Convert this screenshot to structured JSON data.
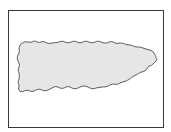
{
  "map": {
    "region_name": "Puerto Rico",
    "type": "outline",
    "colors": {
      "background": "#ffffff",
      "frame_border": "#3a3a3a",
      "land_fill": "#e6e6e6",
      "coastline": "#4a4a4a"
    },
    "frame": {
      "x": 8,
      "y": 10,
      "width": 156,
      "height": 118
    }
  }
}
